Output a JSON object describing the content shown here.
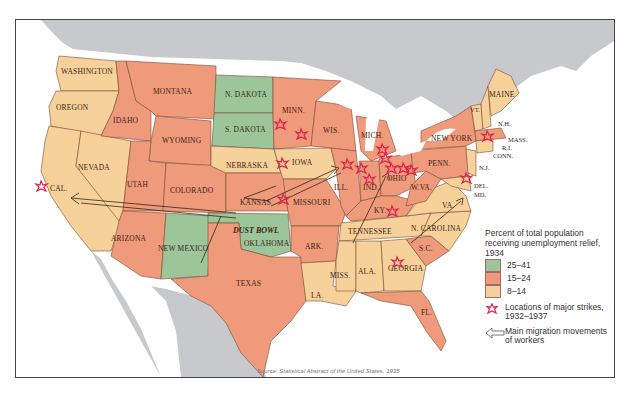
{
  "colors": {
    "high": "#9cc69a",
    "mid": "#ef9a7a",
    "low": "#f7d19a",
    "land_other": "#c8c9cc",
    "water": "#ffffff",
    "strike": "#e0224a",
    "border": "#7a4a38"
  },
  "states": [
    {
      "name": "WASHINGTON",
      "tier": "low"
    },
    {
      "name": "OREGON",
      "tier": "low"
    },
    {
      "name": "CAL.",
      "tier": "low"
    },
    {
      "name": "NEVADA",
      "tier": "low"
    },
    {
      "name": "IDAHO",
      "tier": "mid"
    },
    {
      "name": "MONTANA",
      "tier": "mid"
    },
    {
      "name": "WYOMING",
      "tier": "mid"
    },
    {
      "name": "UTAH",
      "tier": "mid"
    },
    {
      "name": "COLORADO",
      "tier": "mid"
    },
    {
      "name": "ARIZONA",
      "tier": "mid"
    },
    {
      "name": "NEW MEXICO",
      "tier": "high"
    },
    {
      "name": "N. DAKOTA",
      "tier": "high"
    },
    {
      "name": "S. DAKOTA",
      "tier": "high"
    },
    {
      "name": "NEBRASKA",
      "tier": "low"
    },
    {
      "name": "KANSAS",
      "tier": "mid"
    },
    {
      "name": "OKLAHOMA",
      "tier": "high"
    },
    {
      "name": "TEXAS",
      "tier": "mid"
    },
    {
      "name": "MINN.",
      "tier": "mid"
    },
    {
      "name": "IOWA",
      "tier": "low"
    },
    {
      "name": "MISSOURI",
      "tier": "mid"
    },
    {
      "name": "ARK.",
      "tier": "mid"
    },
    {
      "name": "LA.",
      "tier": "low"
    },
    {
      "name": "WIS.",
      "tier": "mid"
    },
    {
      "name": "ILL.",
      "tier": "mid"
    },
    {
      "name": "MICH.",
      "tier": "mid"
    },
    {
      "name": "IND.",
      "tier": "mid"
    },
    {
      "name": "OHIO",
      "tier": "mid"
    },
    {
      "name": "KY.",
      "tier": "mid"
    },
    {
      "name": "TENNESSEE",
      "tier": "low"
    },
    {
      "name": "MISS.",
      "tier": "low"
    },
    {
      "name": "ALA.",
      "tier": "low"
    },
    {
      "name": "GEORGIA",
      "tier": "low"
    },
    {
      "name": "FL.",
      "tier": "mid"
    },
    {
      "name": "S.C.",
      "tier": "mid"
    },
    {
      "name": "N. CAROLINA",
      "tier": "low"
    },
    {
      "name": "VA.",
      "tier": "low"
    },
    {
      "name": "W.VA.",
      "tier": "mid"
    },
    {
      "name": "PENN.",
      "tier": "mid"
    },
    {
      "name": "NEW YORK",
      "tier": "mid"
    },
    {
      "name": "VT.",
      "tier": "low"
    },
    {
      "name": "N.H.",
      "tier": "low"
    },
    {
      "name": "MAINE",
      "tier": "low"
    },
    {
      "name": "MASS.",
      "tier": "mid"
    },
    {
      "name": "R.I.",
      "tier": "low"
    },
    {
      "name": "CONN.",
      "tier": "low"
    },
    {
      "name": "N.J.",
      "tier": "low"
    },
    {
      "name": "DEL.",
      "tier": "low"
    },
    {
      "name": "MD.",
      "tier": "low"
    }
  ],
  "annotations": {
    "dust_bowl": "DUST BOWL"
  },
  "legend": {
    "title": "Percent of total population receiving unemployment relief, 1934",
    "items": [
      {
        "label": "25–41",
        "tier": "high"
      },
      {
        "label": "15–24",
        "tier": "mid"
      },
      {
        "label": "8–14",
        "tier": "low"
      }
    ],
    "strikes_label": "Locations of major strikes, 1932–1937",
    "migration_label": "Main migration movements of workers"
  },
  "source": {
    "prefix": "Source: ",
    "title": "Statistical Abstract of the United States, 1935"
  }
}
